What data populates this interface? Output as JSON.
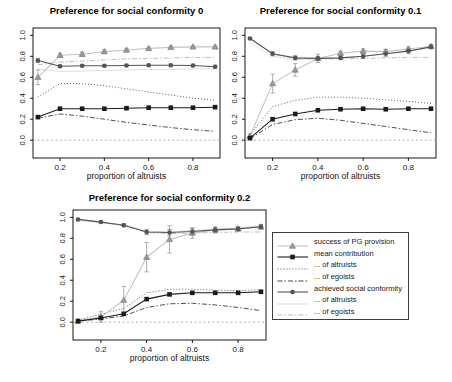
{
  "figure": {
    "background": "#ffffff"
  },
  "series_styles": {
    "success_pg": {
      "line_color": "#c3c3c3",
      "marker": "triangle",
      "marker_fill": "#9a9a9a",
      "marker_stroke": "#7d7d7d",
      "err_color": "#9a9a9a"
    },
    "mean_contribution": {
      "line_color": "#1b1b1b",
      "marker": "square",
      "marker_fill": "#1b1b1b",
      "err_color": "#555555"
    },
    "contrib_altruists": {
      "line_color": "#303030",
      "dash": "0.9 2.1"
    },
    "contrib_egoists": {
      "line_color": "#303030",
      "dash": "5 2 1.5 2"
    },
    "conformity": {
      "line_color": "#545454",
      "marker": "circle",
      "marker_fill": "#545454",
      "err_color": "#8a8a8a"
    },
    "conf_altruists": {
      "line_color": "#d9d9d9"
    },
    "conf_egoists": {
      "line_color": "#b2b2b2",
      "dash": "5 2 1.5 2"
    },
    "zero_line": {
      "line_color": "#9a9a9a",
      "dash": "2 2.5"
    }
  },
  "legend": {
    "items": [
      {
        "label": "success of PG provision",
        "series": "success_pg"
      },
      {
        "label": "mean contribution",
        "series": "mean_contribution"
      },
      {
        "label": "... of altruists",
        "series": "contrib_altruists"
      },
      {
        "label": "... of egoists",
        "series": "contrib_egoists"
      },
      {
        "label": "achieved social conformity",
        "series": "conformity"
      },
      {
        "label": "... of altruists",
        "series": "conf_altruists"
      },
      {
        "label": "... of egoists",
        "series": "conf_egoists"
      }
    ]
  },
  "chart_data": [
    {
      "type": "line",
      "title": "Preference for social conformity 0",
      "xlabel": "proportion of altruists",
      "x": [
        0.1,
        0.2,
        0.3,
        0.4,
        0.5,
        0.6,
        0.7,
        0.8,
        0.9
      ],
      "x_ticks": [
        "0.2",
        "0.4",
        "0.6",
        "0.8"
      ],
      "y_ticks": [
        "0.0",
        "0.2",
        "0.4",
        "0.6",
        "0.8",
        "1.0"
      ],
      "xlim": [
        0.078,
        0.922
      ],
      "ylim": [
        -0.17,
        1.07
      ],
      "zero_line": 0.0,
      "series": [
        {
          "name": "conf_altruists",
          "values": [
            0.68,
            0.655,
            0.66,
            0.665,
            0.67,
            0.675,
            0.675,
            0.68,
            0.68
          ]
        },
        {
          "name": "conf_egoists",
          "values": [
            0.72,
            0.745,
            0.755,
            0.765,
            0.775,
            0.78,
            0.785,
            0.79,
            0.79
          ]
        },
        {
          "name": "contrib_altruists",
          "values": [
            0.41,
            0.54,
            0.54,
            0.52,
            0.49,
            0.46,
            0.43,
            0.4,
            0.38
          ]
        },
        {
          "name": "contrib_egoists",
          "values": [
            0.21,
            0.25,
            0.23,
            0.2,
            0.17,
            0.145,
            0.12,
            0.1,
            0.085
          ]
        },
        {
          "name": "success_pg",
          "values": [
            0.6,
            0.81,
            0.82,
            0.845,
            0.86,
            0.875,
            0.885,
            0.89,
            0.89
          ],
          "errors": [
            0.07,
            0.02,
            0.02,
            0.015,
            0.015,
            0.012,
            0.01,
            0.01,
            0.01
          ]
        },
        {
          "name": "conformity",
          "values": [
            0.76,
            0.705,
            0.71,
            0.71,
            0.712,
            0.715,
            0.715,
            0.712,
            0.7
          ],
          "errors": [
            0.02,
            0.012,
            0.01,
            0.01,
            0.01,
            0.01,
            0.01,
            0.012,
            0.015
          ]
        },
        {
          "name": "mean_contribution",
          "values": [
            0.22,
            0.3,
            0.3,
            0.3,
            0.305,
            0.31,
            0.31,
            0.31,
            0.315
          ]
        }
      ]
    },
    {
      "type": "line",
      "title": "Preference for social conformity 0.1",
      "xlabel": "proportion of altruists",
      "x": [
        0.1,
        0.2,
        0.3,
        0.4,
        0.5,
        0.6,
        0.7,
        0.8,
        0.9
      ],
      "x_ticks": [
        "0.2",
        "0.4",
        "0.6",
        "0.8"
      ],
      "y_ticks": [
        "0.0",
        "0.2",
        "0.4",
        "0.6",
        "0.8",
        "1.0"
      ],
      "xlim": [
        0.078,
        0.922
      ],
      "ylim": [
        -0.17,
        1.07
      ],
      "zero_line": 0.0,
      "series": [
        {
          "name": "conf_altruists",
          "values": [
            0.93,
            0.8,
            0.77,
            0.775,
            0.785,
            0.8,
            0.825,
            0.85,
            0.885
          ]
        },
        {
          "name": "conf_egoists",
          "values": [
            0.97,
            0.82,
            0.78,
            0.775,
            0.775,
            0.78,
            0.785,
            0.79,
            0.79
          ]
        },
        {
          "name": "contrib_altruists",
          "values": [
            0.05,
            0.32,
            0.38,
            0.41,
            0.41,
            0.4,
            0.385,
            0.37,
            0.35
          ]
        },
        {
          "name": "contrib_egoists",
          "values": [
            0.015,
            0.15,
            0.195,
            0.21,
            0.19,
            0.16,
            0.13,
            0.1,
            0.07
          ]
        },
        {
          "name": "success_pg",
          "values": [
            0.04,
            0.54,
            0.67,
            0.78,
            0.83,
            0.85,
            0.845,
            0.87,
            0.895
          ],
          "errors": [
            0.02,
            0.09,
            0.06,
            0.04,
            0.02,
            0.02,
            0.02,
            0.02,
            0.015
          ]
        },
        {
          "name": "conformity",
          "values": [
            0.97,
            0.825,
            0.785,
            0.78,
            0.785,
            0.8,
            0.825,
            0.85,
            0.89
          ],
          "errors": [
            0.01,
            0.02,
            0.02,
            0.015,
            0.015,
            0.02,
            0.025,
            0.025,
            0.02
          ]
        },
        {
          "name": "mean_contribution",
          "values": [
            0.02,
            0.2,
            0.25,
            0.285,
            0.295,
            0.3,
            0.295,
            0.3,
            0.3
          ]
        }
      ]
    },
    {
      "type": "line",
      "title": "Preference for social conformity 0.2",
      "xlabel": "proportion of altruists",
      "x": [
        0.1,
        0.2,
        0.3,
        0.4,
        0.5,
        0.6,
        0.7,
        0.8,
        0.9
      ],
      "x_ticks": [
        "0.2",
        "0.4",
        "0.6",
        "0.8"
      ],
      "y_ticks": [
        "0.0",
        "0.2",
        "0.4",
        "0.6",
        "0.8",
        "1.0"
      ],
      "xlim": [
        0.078,
        0.922
      ],
      "ylim": [
        -0.17,
        1.07
      ],
      "zero_line": 0.0,
      "series": [
        {
          "name": "conf_altruists",
          "values": [
            0.97,
            0.95,
            0.93,
            0.87,
            0.86,
            0.875,
            0.89,
            0.9,
            0.92
          ]
        },
        {
          "name": "conf_egoists",
          "values": [
            0.98,
            0.955,
            0.92,
            0.855,
            0.845,
            0.85,
            0.855,
            0.86,
            0.86
          ]
        },
        {
          "name": "contrib_altruists",
          "values": [
            0.02,
            0.075,
            0.13,
            0.28,
            0.315,
            0.315,
            0.305,
            0.3,
            0.31
          ]
        },
        {
          "name": "contrib_egoists",
          "values": [
            0.01,
            0.03,
            0.06,
            0.14,
            0.175,
            0.18,
            0.165,
            0.14,
            0.11
          ]
        },
        {
          "name": "success_pg",
          "values": [
            0.01,
            0.05,
            0.21,
            0.62,
            0.79,
            0.85,
            0.88,
            0.89,
            0.91
          ],
          "errors": [
            0.01,
            0.05,
            0.13,
            0.14,
            0.13,
            0.05,
            0.03,
            0.02,
            0.02
          ]
        },
        {
          "name": "conformity",
          "values": [
            0.98,
            0.955,
            0.925,
            0.86,
            0.855,
            0.865,
            0.88,
            0.89,
            0.91
          ],
          "errors": [
            0.01,
            0.01,
            0.015,
            0.025,
            0.03,
            0.03,
            0.02,
            0.02,
            0.02
          ]
        },
        {
          "name": "mean_contribution",
          "values": [
            0.01,
            0.04,
            0.08,
            0.22,
            0.265,
            0.28,
            0.28,
            0.28,
            0.29
          ]
        }
      ]
    }
  ]
}
